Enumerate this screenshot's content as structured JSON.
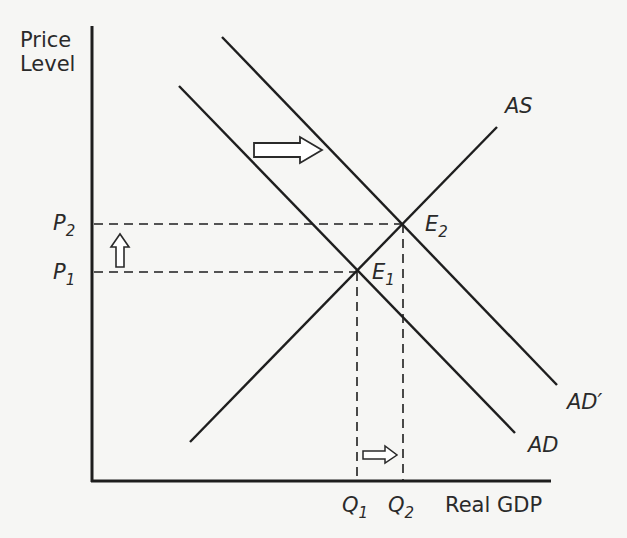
{
  "diagram": {
    "title": "",
    "y_axis_label_line1": "Price",
    "y_axis_label_line2": "Level",
    "x_axis_label": "Real GDP",
    "curves": {
      "as": "AS",
      "ad": "AD",
      "ad_prime": "AD′"
    },
    "equilibria": [
      {
        "letter": "E",
        "sub": "1"
      },
      {
        "letter": "E",
        "sub": "2"
      }
    ],
    "price_levels": [
      {
        "letter": "P",
        "sub": "1"
      },
      {
        "letter": "P",
        "sub": "2"
      }
    ],
    "quantities": [
      {
        "letter": "Q",
        "sub": "1"
      },
      {
        "letter": "Q",
        "sub": "2"
      }
    ],
    "arrows": {
      "demand_shift": "right",
      "price_change": "up",
      "output_change": "right"
    },
    "colors": {
      "background": "#f6f6f4",
      "ink": "#1e1e1e",
      "label": "#2a2a2a"
    }
  }
}
